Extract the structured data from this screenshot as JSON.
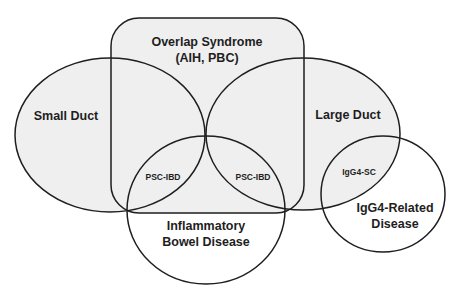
{
  "diagram": {
    "type": "venn",
    "colors": {
      "background": "#ffffff",
      "shaded_fill": "#efefef",
      "stroke": "#1e1e1e",
      "text": "#1e1e1e"
    },
    "sets": {
      "overlap": {
        "line1": "Overlap Syndrome",
        "line2": "(AIH, PBC)"
      },
      "small_duct": {
        "label": "Small Duct"
      },
      "large_duct": {
        "label": "Large Duct"
      },
      "ibd": {
        "line1": "Inflammatory",
        "line2": "Bowel Disease"
      },
      "igg4": {
        "line1": "IgG4-Related",
        "line2": "Disease"
      }
    },
    "intersections": {
      "small_duct_ibd": "PSC-IBD",
      "large_duct_ibd": "PSC-IBD",
      "large_duct_igg4": "IgG4-SC"
    }
  }
}
